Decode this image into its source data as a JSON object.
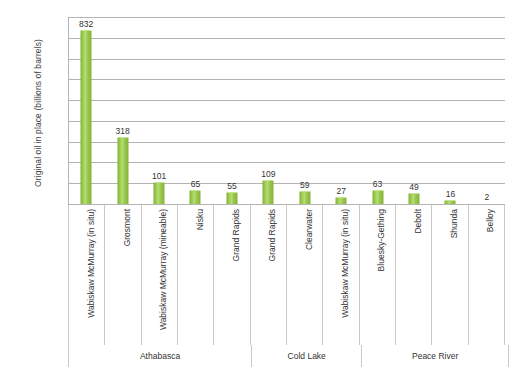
{
  "chart_data": {
    "type": "bar",
    "title": "",
    "xlabel": "",
    "ylabel": "Original oil in place (billions of barrels)",
    "ylim": [
      0,
      900
    ],
    "yticks": [
      900,
      800,
      700,
      600,
      500,
      400,
      300,
      200,
      100,
      0
    ],
    "grid": true,
    "legend": "none",
    "categories": [
      "Wabiskaw McMurray (in situ)",
      "Grosmont",
      "Wabiskaw McMurray (mineable)",
      "Nisku",
      "Grand Rapids",
      "Grand Rapids",
      "Clearwater",
      "Wabiskaw McMurray (in situ)",
      "Bluesky-Gething",
      "Debolt",
      "Shunda",
      "Belloy"
    ],
    "values": [
      832,
      318,
      101,
      65,
      55,
      109,
      59,
      27,
      63,
      49,
      16,
      2
    ],
    "groups": [
      {
        "label": "Athabasca",
        "span": 5
      },
      {
        "label": "Cold Lake",
        "span": 3
      },
      {
        "label": "Peace River",
        "span": 4
      }
    ],
    "bar_color": "#8CBE3F"
  }
}
